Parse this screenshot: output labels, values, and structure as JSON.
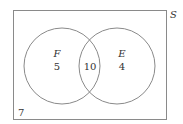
{
  "diagram": {
    "type": "venn",
    "universe_label": "S",
    "sets": [
      {
        "name": "F",
        "only_count": "5"
      },
      {
        "name": "E",
        "only_count": "4"
      }
    ],
    "intersection_count": "10",
    "outside_count": "7",
    "colors": {
      "stroke": "#8a8a8a",
      "text": "#333333",
      "background": "#ffffff"
    }
  }
}
